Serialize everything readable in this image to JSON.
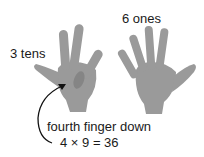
{
  "labels": {
    "tens": "3 tens",
    "ones": "6 ones",
    "caption": "fourth finger down",
    "equation": "4 × 9 = 36"
  },
  "colors": {
    "hand": "#9a9a9a",
    "hand_shadow": "#858585",
    "arrow": "#111111"
  }
}
